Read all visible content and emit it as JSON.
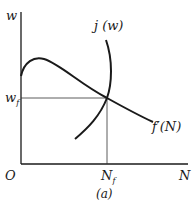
{
  "diagram": {
    "caption": "(a)",
    "axes": {
      "y_label": "w",
      "x_label": "N",
      "origin_label": "O"
    },
    "equilibrium": {
      "w_label": "w",
      "w_sub": "f",
      "n_label": "N",
      "n_sub": "f"
    },
    "curves": [
      {
        "name": "j-curve",
        "label": "j (w)"
      },
      {
        "name": "marginal-product-curve",
        "label": "f′(N)"
      }
    ]
  }
}
